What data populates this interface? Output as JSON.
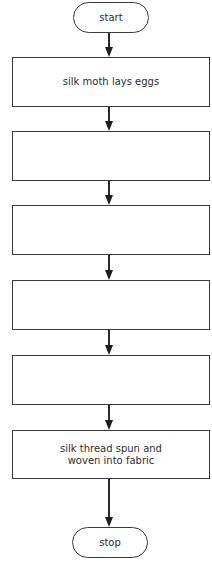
{
  "diagram": {
    "type": "flowchart",
    "direction": "top-to-bottom",
    "start": {
      "label": "start",
      "shape": "terminal"
    },
    "steps": [
      {
        "label": "silk moth lays eggs",
        "shape": "process"
      },
      {
        "label": "",
        "shape": "process"
      },
      {
        "label": "",
        "shape": "process"
      },
      {
        "label": "",
        "shape": "process"
      },
      {
        "label": "",
        "shape": "process"
      },
      {
        "label": "silk thread spun and woven into fabric",
        "shape": "process"
      }
    ],
    "stop": {
      "label": "stop",
      "shape": "terminal"
    },
    "colors": {
      "stroke": "#3a3a3a",
      "fill": "#ffffff",
      "text": "#2e2e2e"
    }
  }
}
